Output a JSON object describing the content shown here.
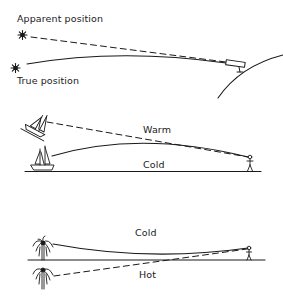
{
  "diagram": {
    "type": "atmospheric-refraction-illustration",
    "panels": [
      {
        "id": "astronomical-refraction",
        "labels": {
          "apparent": "Apparent position",
          "true": "True position"
        },
        "objects": [
          "star-apparent",
          "star-true",
          "telescope",
          "earth-surface"
        ],
        "rays": [
          {
            "style": "dashed",
            "meaning": "apparent line of sight"
          },
          {
            "style": "solid",
            "meaning": "true curved light path"
          }
        ]
      },
      {
        "id": "superior-mirage",
        "labels": {
          "upper_layer": "Warm",
          "lower_layer": "Cold"
        },
        "objects": [
          "ship-apparent-elevated",
          "ship-true",
          "observer",
          "ground-line"
        ],
        "rays": [
          {
            "style": "dashed",
            "meaning": "apparent line of sight"
          },
          {
            "style": "solid",
            "meaning": "light path bending downward"
          }
        ]
      },
      {
        "id": "inferior-mirage",
        "labels": {
          "upper_layer": "Cold",
          "lower_layer": "Hot"
        },
        "objects": [
          "palm-tree-true",
          "palm-tree-inverted-image",
          "observer",
          "ground-line"
        ],
        "rays": [
          {
            "style": "solid",
            "meaning": "light path bending upward"
          },
          {
            "style": "dashed",
            "meaning": "apparent line of sight"
          }
        ]
      }
    ],
    "colors": {
      "ink": "#1a1a1a",
      "background": "#ffffff"
    }
  }
}
